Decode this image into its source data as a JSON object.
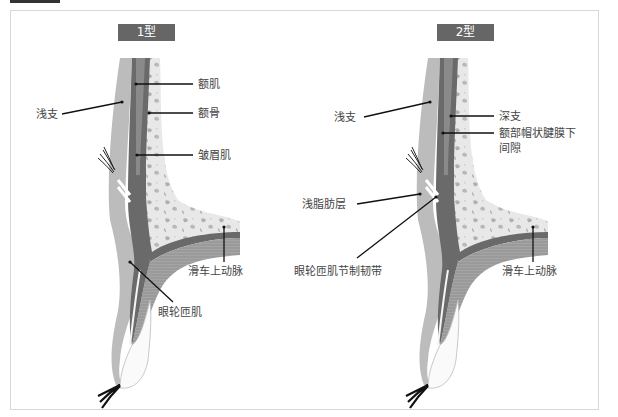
{
  "panels": [
    {
      "title": "1型",
      "labels": {
        "superficial_branch": "浅支",
        "frontalis": "额肌",
        "frontal_bone": "额骨",
        "corrugator": "皱眉肌",
        "supratrochlear_artery": "滑车上动脉",
        "orbicularis_oculi": "眼轮匝肌"
      }
    },
    {
      "title": "2型",
      "labels": {
        "superficial_branch": "浅支",
        "deep_branch": "深支",
        "subgaleal_space_line1": "额部帽状腱膜下",
        "subgaleal_space_line2": "间隙",
        "superficial_fat_layer": "浅脂肪层",
        "orbicularis_retaining_ligament": "眼轮匝肌节制韧带",
        "supratrochlear_artery": "滑车上动脉"
      }
    }
  ],
  "colors": {
    "badge": "#666666",
    "bone_fill": "#e8e8e8",
    "bone_spots": "#b5b5b5",
    "muscle_dark": "#5f5f5f",
    "muscle_mid": "#8c8c8c",
    "skin_light": "#b8b8b8",
    "frame_border": "#d8d8d8"
  }
}
